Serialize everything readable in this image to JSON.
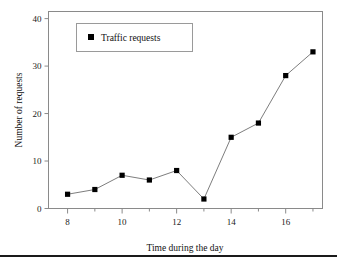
{
  "chart_data": {
    "type": "line",
    "title": "",
    "subtitle": "",
    "xlabel": "Time during the day",
    "ylabel": "Number of requests",
    "x": [
      8,
      9,
      10,
      11,
      12,
      13,
      14,
      15,
      16,
      17
    ],
    "series": [
      {
        "name": "Traffic requests",
        "values": [
          3,
          4,
          7,
          6,
          8,
          2,
          15,
          18,
          28,
          33
        ],
        "marker": "square",
        "marker_color": "#000000",
        "line_color": "#6e6e6e"
      }
    ],
    "xlim": [
      7.3,
      17.35
    ],
    "ylim": [
      0,
      41.5
    ],
    "xticks": [
      8,
      10,
      12,
      14,
      16
    ],
    "xtick_labels": [
      "8",
      "10",
      "12",
      "14",
      "16"
    ],
    "xminorticks": [
      9,
      11,
      13,
      15,
      17
    ],
    "yticks": [
      0,
      10,
      20,
      30,
      40
    ],
    "ytick_labels": [
      "0",
      "10",
      "20",
      "30",
      "40"
    ],
    "grid": false,
    "legend": {
      "position": "upper-left-inside",
      "entries": [
        "Traffic requests"
      ],
      "bordered": true
    },
    "frame": "box"
  },
  "figure": {
    "background_color": "#ffffff",
    "frame_color": "#8a8a8a",
    "text_color": "#000000",
    "footer_rule_color": "#1a1a1a"
  }
}
